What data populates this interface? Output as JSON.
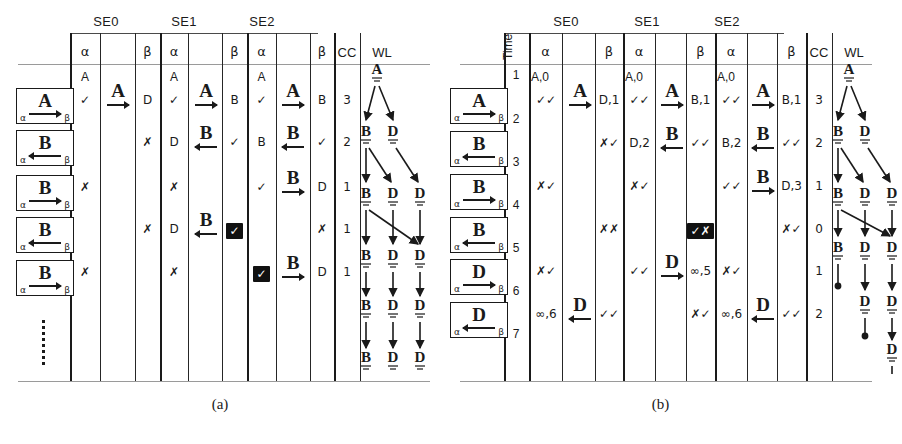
{
  "figure": {
    "caption_a": "(a)",
    "caption_b": "(b)"
  },
  "panel_a": {
    "groups": [
      "SE0",
      "SE1",
      "SE2"
    ],
    "columns": [
      "α",
      "β",
      "α",
      "β",
      "α",
      "β",
      "CC",
      "WL"
    ],
    "col_alpha": "α",
    "col_beta": "β",
    "col_cc": "CC",
    "col_wl": "WL",
    "init_row": [
      "A",
      "A",
      "A"
    ],
    "rows": [
      {
        "msg": {
          "letter": "A",
          "dir": "right",
          "alpha": "α",
          "beta": "β"
        },
        "se0_alpha": "✓",
        "se0_mid": {
          "letter": "A",
          "dir": "right"
        },
        "se0_beta": "D",
        "se1_alpha": "✓",
        "se1_mid": {
          "letter": "A",
          "dir": "right"
        },
        "se1_beta": "B",
        "se2_alpha": "✓",
        "se2_mid": {
          "letter": "A",
          "dir": "right"
        },
        "se2_beta": "B",
        "cc": "3"
      },
      {
        "msg": {
          "letter": "B",
          "dir": "left",
          "alpha": "α",
          "beta": "β"
        },
        "se0_alpha": "",
        "se0_mid": null,
        "se0_beta": "✗",
        "se1_alpha": "D",
        "se1_mid": {
          "letter": "B",
          "dir": "left"
        },
        "se1_beta": "✓",
        "se2_alpha": "B",
        "se2_mid": {
          "letter": "B",
          "dir": "left"
        },
        "se2_beta": "✓",
        "cc": "2"
      },
      {
        "msg": {
          "letter": "B",
          "dir": "right",
          "alpha": "α",
          "beta": "β"
        },
        "se0_alpha": "✗",
        "se0_mid": null,
        "se0_beta": "",
        "se1_alpha": "✗",
        "se1_mid": null,
        "se1_beta": "",
        "se2_alpha": "✓",
        "se2_mid": {
          "letter": "B",
          "dir": "right"
        },
        "se2_beta": "D",
        "cc": "1"
      },
      {
        "msg": {
          "letter": "B",
          "dir": "left",
          "alpha": "α",
          "beta": "β"
        },
        "se0_alpha": "",
        "se0_mid": null,
        "se0_beta": "✗",
        "se1_alpha": "D",
        "se1_mid": {
          "letter": "B",
          "dir": "left"
        },
        "se1_beta": "✓",
        "se1_beta_highlight": true,
        "se2_alpha": "",
        "se2_mid": null,
        "se2_beta": "✗",
        "cc": "1"
      },
      {
        "msg": {
          "letter": "B",
          "dir": "right",
          "alpha": "α",
          "beta": "β"
        },
        "se0_alpha": "✗",
        "se0_mid": null,
        "se0_beta": "",
        "se1_alpha": "✗",
        "se1_mid": null,
        "se1_beta": "",
        "se2_alpha": "✓",
        "se2_alpha_highlight": true,
        "se2_mid": {
          "letter": "B",
          "dir": "right"
        },
        "se2_beta": "D",
        "cc": "1"
      }
    ],
    "continuation": "vertical-dots",
    "wl_tree": {
      "root": "A",
      "levels": [
        [
          "A"
        ],
        [
          "B",
          "D"
        ],
        [
          "B",
          "D",
          "D"
        ],
        [
          "B",
          "D",
          "D"
        ],
        [
          "B",
          "D",
          "D"
        ],
        [
          "B",
          "D",
          "D"
        ]
      ]
    }
  },
  "panel_b": {
    "time_label": "Time",
    "groups": [
      "SE0",
      "SE1",
      "SE2"
    ],
    "col_alpha": "α",
    "col_beta": "β",
    "col_cc": "CC",
    "col_wl": "WL",
    "time_ticks": [
      "1",
      "2",
      "3",
      "4",
      "5",
      "6",
      "7"
    ],
    "init_row": [
      "A,0",
      "A,0",
      "A,0"
    ],
    "rows": [
      {
        "msg": {
          "letter": "A",
          "dir": "right",
          "alpha": "α",
          "beta": "β"
        },
        "se0_alpha": "✓✓",
        "se0_mid": {
          "letter": "A",
          "dir": "right"
        },
        "se0_beta": "D,1",
        "se1_alpha": "✓✓",
        "se1_mid": {
          "letter": "A",
          "dir": "right"
        },
        "se1_beta": "B,1",
        "se2_alpha": "✓✓",
        "se2_mid": {
          "letter": "A",
          "dir": "right"
        },
        "se2_beta": "B,1",
        "cc": "3"
      },
      {
        "msg": {
          "letter": "B",
          "dir": "left",
          "alpha": "α",
          "beta": "β"
        },
        "se0_alpha": "",
        "se0_mid": null,
        "se0_beta": "✗✓",
        "se1_alpha": "D,2",
        "se1_mid": {
          "letter": "B",
          "dir": "left"
        },
        "se1_beta": "✓✓",
        "se2_alpha": "B,2",
        "se2_mid": {
          "letter": "B",
          "dir": "left"
        },
        "se2_beta": "✓✓",
        "cc": "2"
      },
      {
        "msg": {
          "letter": "B",
          "dir": "right",
          "alpha": "α",
          "beta": "β"
        },
        "se0_alpha": "✗✓",
        "se0_mid": null,
        "se0_beta": "",
        "se1_alpha": "✗✓",
        "se1_mid": null,
        "se1_beta": "",
        "se2_alpha": "✓✓",
        "se2_mid": {
          "letter": "B",
          "dir": "right"
        },
        "se2_beta": "D,3",
        "cc": "1"
      },
      {
        "msg": {
          "letter": "B",
          "dir": "left",
          "alpha": "α",
          "beta": "β"
        },
        "se0_alpha": "",
        "se0_mid": null,
        "se0_beta": "✗✗",
        "se1_alpha": "",
        "se1_mid": null,
        "se1_beta": "✓✗",
        "se1_beta_highlight": true,
        "se2_alpha": "",
        "se2_mid": null,
        "se2_beta": "✗✓",
        "cc": "0"
      },
      {
        "msg": {
          "letter": "D",
          "dir": "right",
          "alpha": "α",
          "beta": "β"
        },
        "se0_alpha": "✗✓",
        "se0_mid": null,
        "se0_beta": "",
        "se1_alpha": "✓✓",
        "se1_mid": {
          "letter": "D",
          "dir": "right"
        },
        "se1_beta": "∞,5",
        "se2_alpha": "✗✓",
        "se2_mid": null,
        "se2_beta": "",
        "cc": "1"
      },
      {
        "msg": {
          "letter": "D",
          "dir": "left",
          "alpha": "α",
          "beta": "β"
        },
        "se0_alpha": "∞,6",
        "se0_mid": {
          "letter": "D",
          "dir": "left"
        },
        "se0_beta": "✓✓",
        "se1_alpha": "",
        "se1_mid": null,
        "se1_beta": "✗✓",
        "se2_alpha": "∞,6",
        "se2_mid": {
          "letter": "D",
          "dir": "left"
        },
        "se2_beta": "✓✓",
        "cc": "2"
      }
    ],
    "wl_tree": {
      "root": "A",
      "levels": [
        [
          "A"
        ],
        [
          "B",
          "D"
        ],
        [
          "B",
          "D",
          "D"
        ],
        [
          "B",
          "D",
          "D"
        ],
        [
          "D",
          "D"
        ],
        [
          "D"
        ]
      ]
    }
  }
}
